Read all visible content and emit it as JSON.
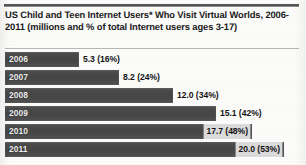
{
  "chart_data": {
    "type": "bar",
    "orientation": "horizontal",
    "title": "US Child and Teen Internet Users* Who Visit Virtual Worlds, 2006-2011 (millions and % of total Internet users ages 3-17)",
    "xlabel": "",
    "ylabel": "",
    "xlim": [
      0,
      21.2
    ],
    "grid": false,
    "legend": null,
    "categories": [
      "2006",
      "2007",
      "2008",
      "2009",
      "2010",
      "2011"
    ],
    "values": [
      5.3,
      8.2,
      12.0,
      15.1,
      17.7,
      20.0
    ],
    "percents": [
      16,
      24,
      34,
      42,
      48,
      53
    ],
    "bars": [
      {
        "year": "2006",
        "value": 5.3,
        "percent": 16,
        "label": "5.3 (16%)",
        "label_placement": "outside"
      },
      {
        "year": "2007",
        "value": 8.2,
        "percent": 24,
        "label": "8.2 (24%)",
        "label_placement": "outside"
      },
      {
        "year": "2008",
        "value": 12.0,
        "percent": 34,
        "label": "12.0 (34%)",
        "label_placement": "outside"
      },
      {
        "year": "2009",
        "value": 15.1,
        "percent": 42,
        "label": "15.1 (42%)",
        "label_placement": "outside"
      },
      {
        "year": "2010",
        "value": 17.7,
        "percent": 48,
        "label": "17.7 (48%)",
        "label_placement": "inside-end"
      },
      {
        "year": "2011",
        "value": 20.0,
        "percent": 53,
        "label": "20.0 (53%)",
        "label_placement": "inside-end"
      }
    ],
    "colors": {
      "bar": "#4b4b4b",
      "year_label": "#f2f2f2",
      "value_label": "#141414",
      "background": "#fdfdfc",
      "rule": "#555555"
    }
  }
}
